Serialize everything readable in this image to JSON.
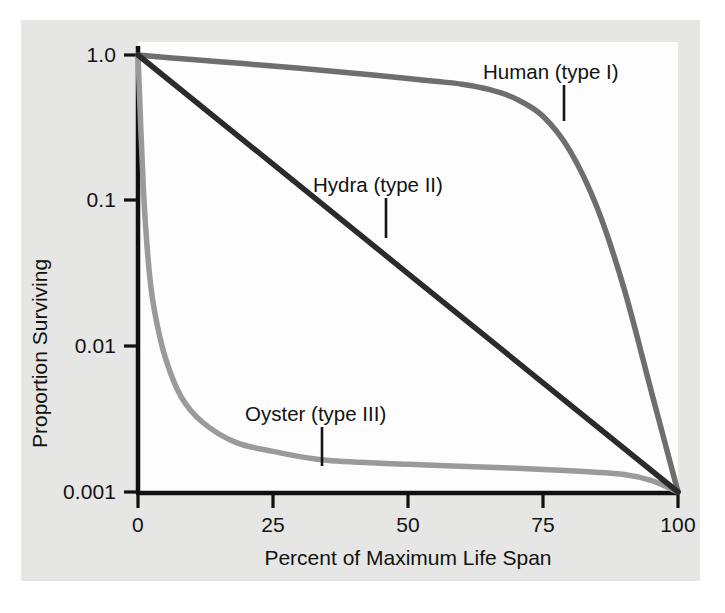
{
  "chart_data": {
    "type": "line",
    "title": "",
    "xlabel": "Percent of Maximum Life Span",
    "ylabel": "Proportion Surviving",
    "xlim": [
      0,
      100
    ],
    "ylim": [
      0.001,
      1.0
    ],
    "yscale": "log",
    "xscale": "linear",
    "grid": false,
    "legend_position": "inline-annotations",
    "xticks": [
      "0",
      "25",
      "50",
      "75",
      "100"
    ],
    "xtick_values": [
      0,
      25,
      50,
      75,
      100
    ],
    "yticks": [
      "1.0",
      "0.1",
      "0.01",
      "0.001"
    ],
    "ytick_values": [
      1.0,
      0.1,
      0.01,
      0.001
    ],
    "series": [
      {
        "name": "Human (type I)",
        "color": "#6e6e6e",
        "x": [
          0,
          10,
          20,
          30,
          40,
          50,
          55,
          60,
          65,
          70,
          75,
          80,
          85,
          90,
          95,
          100
        ],
        "values": [
          1.0,
          0.93,
          0.87,
          0.81,
          0.75,
          0.69,
          0.66,
          0.63,
          0.58,
          0.5,
          0.38,
          0.22,
          0.09,
          0.025,
          0.005,
          0.001
        ]
      },
      {
        "name": "Hydra (type II)",
        "color": "#2b2b2b",
        "x": [
          0,
          25,
          50,
          75,
          100
        ],
        "values": [
          1.0,
          0.178,
          0.0316,
          0.00562,
          0.001
        ]
      },
      {
        "name": "Oyster (type III)",
        "color": "#9a9a9a",
        "x": [
          0,
          1,
          2,
          3,
          5,
          8,
          12,
          18,
          25,
          35,
          50,
          65,
          80,
          90,
          95,
          100
        ],
        "values": [
          1.0,
          0.12,
          0.035,
          0.018,
          0.0085,
          0.0045,
          0.003,
          0.0022,
          0.0019,
          0.00165,
          0.00155,
          0.00148,
          0.0014,
          0.00132,
          0.0012,
          0.001
        ]
      }
    ],
    "annotations": [
      {
        "text": "Human (type I)",
        "series": "Human (type I)"
      },
      {
        "text": "Hydra (type II)",
        "series": "Hydra (type II)"
      },
      {
        "text": "Oyster (type III)",
        "series": "Oyster (type III)"
      }
    ]
  },
  "axis": {
    "y_label": "Proportion Surviving",
    "x_label": "Percent of Maximum Life Span",
    "y_ticks": [
      "1.0",
      "0.1",
      "0.01",
      "0.001"
    ],
    "x_ticks": [
      "0",
      "25",
      "50",
      "75",
      "100"
    ]
  },
  "labels": {
    "human": "Human (type I)",
    "hydra": "Hydra (type II)",
    "oyster": "Oyster (type III)"
  },
  "colors": {
    "panel_background": "#e6e6e4",
    "plot_background": "#fdfdfd",
    "axis": "#101010",
    "human": "#6e6e6e",
    "hydra": "#2b2b2b",
    "oyster": "#9a9a9a",
    "text": "#121212"
  }
}
